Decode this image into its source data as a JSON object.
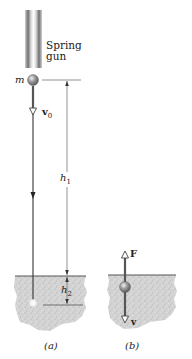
{
  "figure": {
    "panels": [
      {
        "id": "a",
        "caption": "(a)",
        "labels": {
          "launcher": "Spring\ngun",
          "launcher_line1": "Spring",
          "launcher_line2": "gun",
          "mass": "m",
          "initial_velocity": "v",
          "initial_velocity_sub": "0",
          "height_above_ground": "h",
          "height_above_ground_sub": "1",
          "penetration_depth": "h",
          "penetration_depth_sub": "2"
        }
      },
      {
        "id": "b",
        "caption": "(b)",
        "labels": {
          "force": "F",
          "velocity": "v"
        }
      }
    ],
    "colors": {
      "ground_fill": "#d6d6d6",
      "ground_speckle": "#a8a8a8",
      "ground_surface": "#555555",
      "ball": "#8a8a8a",
      "line": "#333333",
      "dimension_line": "#555555",
      "gun_tube": "#9a9a9a"
    }
  }
}
